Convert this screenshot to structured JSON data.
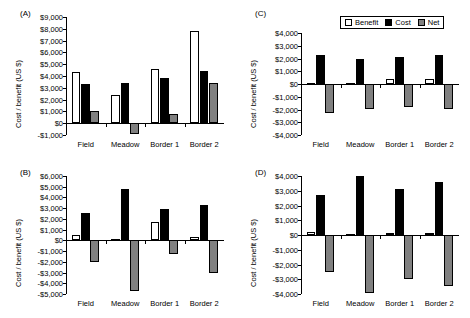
{
  "figure": {
    "categories": [
      "Field",
      "Meadow",
      "Border 1",
      "Border 2"
    ],
    "ylabel": "Cost / benefit (US $)",
    "legend": {
      "benefit": "Benefit",
      "cost": "Cost",
      "net": "Net"
    },
    "colors": {
      "benefit": "#ffffff",
      "cost": "#000000",
      "net": "#808080",
      "axis": "#000000"
    }
  },
  "chart_data": [
    {
      "type": "bar",
      "panel": "(A)",
      "title": "",
      "xlabel": "",
      "ylabel": "Cost / benefit (US $)",
      "categories": [
        "Field",
        "Meadow",
        "Border 1",
        "Border 2"
      ],
      "series": [
        {
          "name": "Benefit",
          "values": [
            4350,
            2400,
            4600,
            7800
          ]
        },
        {
          "name": "Cost",
          "values": [
            3300,
            3400,
            3800,
            4400
          ]
        },
        {
          "name": "Net",
          "values": [
            1050,
            -900,
            800,
            3400
          ]
        }
      ],
      "ylim": [
        -1000,
        9000
      ],
      "yticks": [
        "$9,000",
        "$8,000",
        "$7,000",
        "$6,000",
        "$5,000",
        "$4,000",
        "$3,000",
        "$2,000",
        "$1,000",
        "$0",
        "-$1,000"
      ],
      "ytick_values": [
        9000,
        8000,
        7000,
        6000,
        5000,
        4000,
        3000,
        2000,
        1000,
        0,
        -1000
      ],
      "grid": false,
      "legend_position": "none"
    },
    {
      "type": "bar",
      "panel": "(B)",
      "title": "",
      "xlabel": "",
      "ylabel": "Cost / benefit (US $)",
      "categories": [
        "Field",
        "Meadow",
        "Border 1",
        "Border 2"
      ],
      "series": [
        {
          "name": "Benefit",
          "values": [
            500,
            100,
            1750,
            300
          ]
        },
        {
          "name": "Cost",
          "values": [
            2550,
            4750,
            2950,
            3300
          ]
        },
        {
          "name": "Net",
          "values": [
            -2050,
            -4750,
            -1300,
            -3000
          ]
        }
      ],
      "ylim": [
        -5000,
        6000
      ],
      "yticks": [
        "$6,000",
        "$5,000",
        "$4,000",
        "$3,000",
        "$2,000",
        "$1,000",
        "$0",
        "-$1,000",
        "-$2,000",
        "-$3,000",
        "-$4,000",
        "-$5,000"
      ],
      "ytick_values": [
        6000,
        5000,
        4000,
        3000,
        2000,
        1000,
        0,
        -1000,
        -2000,
        -3000,
        -4000,
        -5000
      ],
      "grid": false,
      "legend_position": "none"
    },
    {
      "type": "bar",
      "panel": "(C)",
      "title": "",
      "xlabel": "",
      "ylabel": "Cost / benefit (US $)",
      "categories": [
        "Field",
        "Meadow",
        "Border 1",
        "Border 2"
      ],
      "series": [
        {
          "name": "Benefit",
          "values": [
            100,
            100,
            400,
            400
          ]
        },
        {
          "name": "Cost",
          "values": [
            2250,
            2000,
            2150,
            2300
          ]
        },
        {
          "name": "Net",
          "values": [
            -2250,
            -1950,
            -1800,
            -1950
          ]
        }
      ],
      "ylim": [
        -4000,
        4000
      ],
      "yticks": [
        "$4,000",
        "$3,000",
        "$2,000",
        "$1,000",
        "$0",
        "-$1,000",
        "-$2,000",
        "-$3,000",
        "-$4,000"
      ],
      "ytick_values": [
        4000,
        3000,
        2000,
        1000,
        0,
        -1000,
        -2000,
        -3000,
        -4000
      ],
      "grid": false,
      "legend_position": "top-right"
    },
    {
      "type": "bar",
      "panel": "(D)",
      "title": "",
      "xlabel": "",
      "ylabel": "Cost / benefit (US $)",
      "categories": [
        "Field",
        "Meadow",
        "Border 1",
        "Border 2"
      ],
      "series": [
        {
          "name": "Benefit",
          "values": [
            200,
            50,
            120,
            150
          ]
        },
        {
          "name": "Cost",
          "values": [
            2700,
            4000,
            3100,
            3600
          ]
        },
        {
          "name": "Net",
          "values": [
            -2500,
            -3950,
            -2950,
            -3450
          ]
        }
      ],
      "ylim": [
        -4000,
        4000
      ],
      "yticks": [
        "$4,000",
        "$3,000",
        "$2,000",
        "$1,000",
        "$0",
        "-$1,000",
        "-$2,000",
        "-$3,000",
        "-$4,000"
      ],
      "ytick_values": [
        4000,
        3000,
        2000,
        1000,
        0,
        -1000,
        -2000,
        -3000,
        -4000
      ],
      "grid": false,
      "legend_position": "none"
    }
  ]
}
